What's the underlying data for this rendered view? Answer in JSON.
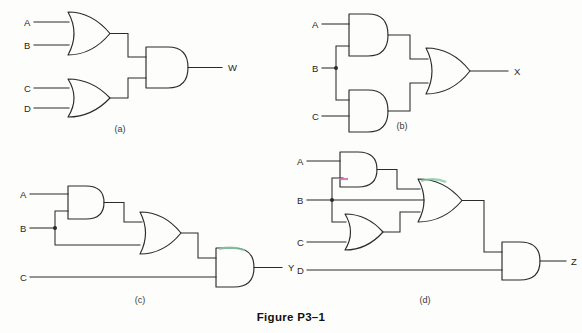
{
  "figure": {
    "caption": "Figure P3–1",
    "background_color": "#fdfdfb",
    "line_color": "#2b2b2b"
  },
  "circuits": [
    {
      "id": "a",
      "sub_label": "(a)",
      "output_label": "W",
      "inputs": [
        "A",
        "B",
        "C",
        "D"
      ],
      "gates": [
        "OR",
        "OR",
        "AND"
      ],
      "expression": "W = (A + B) · (C + D)"
    },
    {
      "id": "b",
      "sub_label": "(b)",
      "output_label": "X",
      "inputs": [
        "A",
        "B",
        "C"
      ],
      "gates": [
        "AND",
        "AND",
        "OR"
      ],
      "expression": "X = (A · B) + (B · C)"
    },
    {
      "id": "c",
      "sub_label": "(c)",
      "output_label": "Y",
      "inputs": [
        "A",
        "B",
        "C"
      ],
      "gates": [
        "AND",
        "OR",
        "AND"
      ],
      "expression": "Y = ((A · B) + B) · C"
    },
    {
      "id": "d",
      "sub_label": "(d)",
      "output_label": "Z",
      "inputs": [
        "A",
        "B",
        "C",
        "D"
      ],
      "gates": [
        "AND",
        "OR",
        "OR",
        "AND"
      ],
      "expression": "Z = ((A · B) + B + (B + C)) · D"
    }
  ],
  "labels": {
    "a_A": "A",
    "a_B": "B",
    "a_C": "C",
    "a_D": "D",
    "a_out": "W",
    "a_sub": "(a)",
    "b_A": "A",
    "b_B": "B",
    "b_C": "C",
    "b_out": "X",
    "b_sub": "(b)",
    "c_A": "A",
    "c_B": "B",
    "c_C": "C",
    "c_out": "Y",
    "c_sub": "(c)",
    "d_A": "A",
    "d_B": "B",
    "d_C": "C",
    "d_D": "D",
    "d_out": "Z",
    "d_sub": "(d)",
    "caption": "Figure P3–1"
  }
}
